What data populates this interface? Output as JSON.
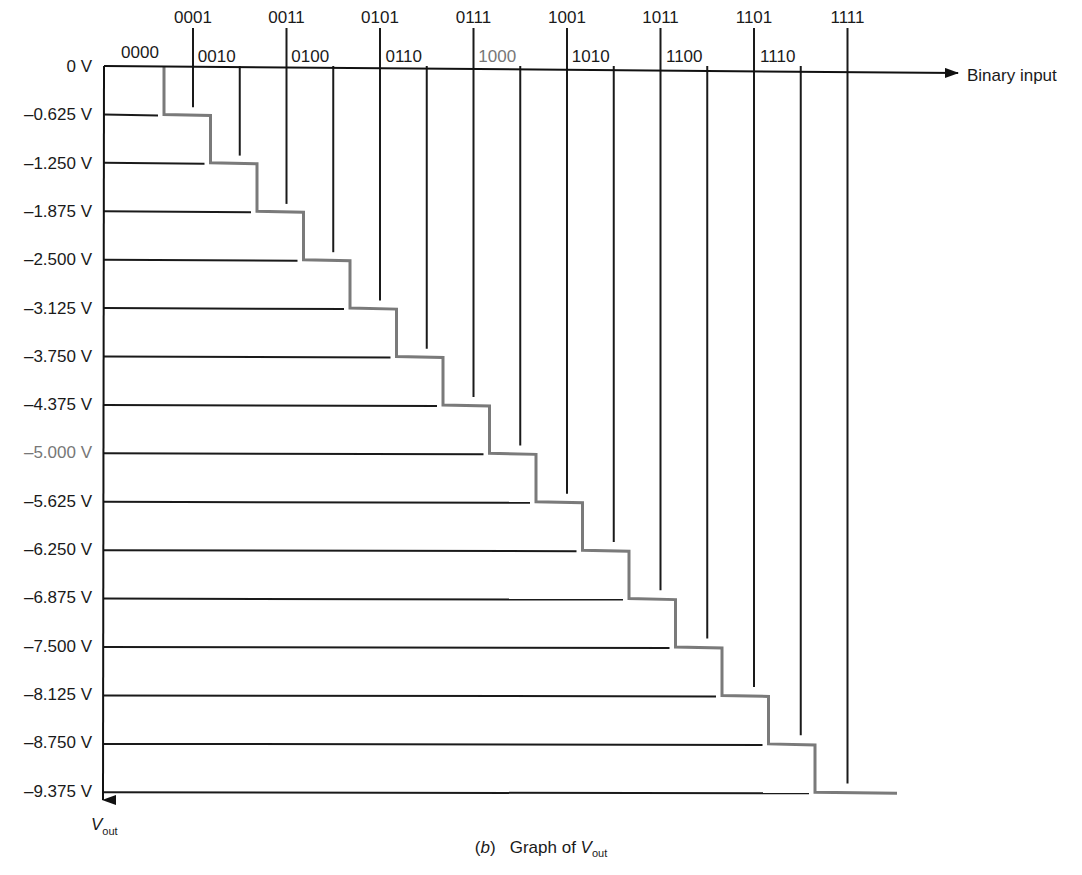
{
  "chart_data": {
    "type": "line",
    "subtype": "staircase",
    "title": "",
    "caption": {
      "panel": "b",
      "text": "Graph of",
      "var_main": "V",
      "var_sub": "out"
    },
    "xlabel": "Binary input",
    "ylabel": {
      "main": "V",
      "sub": "out"
    },
    "y_origin_label": "0 V",
    "categories": [
      "0000",
      "0001",
      "0010",
      "0011",
      "0100",
      "0101",
      "0110",
      "0111",
      "1000",
      "1001",
      "1010",
      "1011",
      "1100",
      "1101",
      "1110",
      "1111"
    ],
    "values": [
      0,
      -0.625,
      -1.25,
      -1.875,
      -2.5,
      -3.125,
      -3.75,
      -4.375,
      -5.0,
      -5.625,
      -6.25,
      -6.875,
      -7.5,
      -8.125,
      -8.75,
      -9.375
    ],
    "y_tick_labels": [
      "0 V",
      "–0.625 V",
      "–1.250 V",
      "–1.875 V",
      "–2.500 V",
      "–3.125 V",
      "–3.750 V",
      "–4.375 V",
      "–5.000 V",
      "–5.625 V",
      "–6.250 V",
      "–6.875 V",
      "–7.500 V",
      "–8.125 V",
      "–8.750 V",
      "–9.375 V"
    ],
    "highlighted_category": "1000",
    "highlighted_y_tick": "–5.000 V",
    "ylim": [
      0,
      -9.375
    ],
    "step_volts": -0.625,
    "grid": true,
    "legend": "none",
    "colors": {
      "axis": "#111111",
      "gridline": "#1a1a1a",
      "staircase": "#7a7a7a",
      "highlight_text": "#777777"
    }
  }
}
